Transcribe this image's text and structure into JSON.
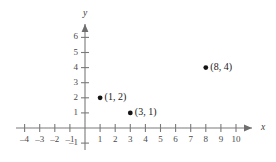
{
  "chart_data": {
    "type": "scatter",
    "title": "",
    "xlabel": "x",
    "ylabel": "y",
    "grid": false,
    "legend": null,
    "xlim": [
      -4.6,
      11.0
    ],
    "ylim": [
      -1.6,
      6.8
    ],
    "x_ticks": [
      -4,
      -3,
      -2,
      -1,
      1,
      2,
      3,
      4,
      5,
      6,
      7,
      8,
      9,
      10
    ],
    "y_ticks": [
      -1,
      1,
      2,
      3,
      4,
      5,
      6
    ],
    "x_tick_labels": [
      "–4",
      "–3",
      "–2",
      "–1",
      "1",
      "2",
      "3",
      "4",
      "5",
      "6",
      "7",
      "8",
      "9",
      "10"
    ],
    "y_tick_labels": [
      "–1",
      "1",
      "2",
      "3",
      "4",
      "5",
      "6"
    ],
    "points": [
      {
        "x": 1,
        "y": 2,
        "label": "(1, 2)"
      },
      {
        "x": 3,
        "y": 1,
        "label": "(3, 1)"
      },
      {
        "x": 8,
        "y": 4,
        "label": "(8, 4)"
      }
    ],
    "axis_color": "#7a7a7a",
    "point_color": "#141414",
    "label_color": "#4a4a4a",
    "background": "#ffffff"
  }
}
